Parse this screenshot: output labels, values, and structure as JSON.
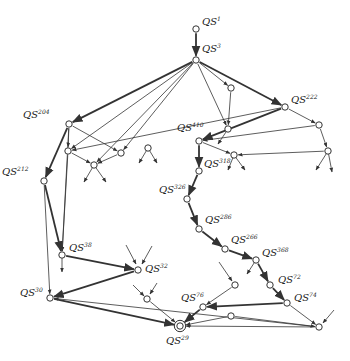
{
  "diagram": {
    "type": "state-transition-graph",
    "prefix": "QS",
    "nodes": [
      {
        "id": "QS1",
        "sup": "1",
        "x": 196,
        "y": 29,
        "label_dx": 6,
        "label_dy": -4,
        "labeled": true
      },
      {
        "id": "QS3",
        "sup": "3",
        "x": 196,
        "y": 60,
        "label_dx": 6,
        "label_dy": -8,
        "labeled": true
      },
      {
        "id": "n_a",
        "x": 231,
        "y": 88,
        "labeled": false
      },
      {
        "id": "QS222",
        "sup": "222",
        "x": 285,
        "y": 107,
        "label_dx": 6,
        "label_dy": -4,
        "labeled": true
      },
      {
        "id": "QS204",
        "sup": "204",
        "x": 69,
        "y": 124,
        "label_dx": -46,
        "label_dy": -6,
        "labeled": true
      },
      {
        "id": "n_b",
        "x": 228,
        "y": 129,
        "labeled": false
      },
      {
        "id": "n_c",
        "x": 319,
        "y": 125,
        "labeled": false
      },
      {
        "id": "QS410",
        "sup": "410",
        "x": 199,
        "y": 141,
        "label_dx": -22,
        "label_dy": -10,
        "labeled": true
      },
      {
        "id": "n_d",
        "x": 68,
        "y": 151,
        "labeled": false
      },
      {
        "id": "n_e",
        "x": 121,
        "y": 153,
        "labeled": false
      },
      {
        "id": "n_f",
        "x": 148,
        "y": 148,
        "labeled": false
      },
      {
        "id": "n_g",
        "x": 328,
        "y": 151,
        "labeled": false
      },
      {
        "id": "n_h",
        "x": 94,
        "y": 165,
        "labeled": false
      },
      {
        "id": "QS318",
        "sup": "318",
        "x": 234,
        "y": 155,
        "label_dx": -30,
        "label_dy": 12,
        "labeled": true
      },
      {
        "id": "QS212",
        "sup": "212",
        "x": 44,
        "y": 181,
        "label_dx": -42,
        "label_dy": -6,
        "labeled": true
      },
      {
        "id": "n_i",
        "x": 199,
        "y": 171,
        "labeled": false
      },
      {
        "id": "QS326",
        "sup": "326",
        "x": 187,
        "y": 199,
        "label_dx": -28,
        "label_dy": -6,
        "labeled": true
      },
      {
        "id": "QS286",
        "sup": "286",
        "x": 199,
        "y": 229,
        "label_dx": 6,
        "label_dy": -6,
        "labeled": true
      },
      {
        "id": "QS266",
        "sup": "266",
        "x": 225,
        "y": 249,
        "label_dx": 6,
        "label_dy": -6,
        "labeled": true
      },
      {
        "id": "QS38",
        "sup": "38",
        "x": 62,
        "y": 255,
        "label_dx": 7,
        "label_dy": -4,
        "labeled": true
      },
      {
        "id": "QS368",
        "sup": "368",
        "x": 256,
        "y": 260,
        "label_dx": 6,
        "label_dy": -4,
        "labeled": true
      },
      {
        "id": "QS32",
        "sup": "32",
        "x": 138,
        "y": 270,
        "label_dx": 7,
        "label_dy": 2,
        "labeled": true
      },
      {
        "id": "n_j",
        "x": 235,
        "y": 285,
        "labeled": false
      },
      {
        "id": "QS72",
        "sup": "72",
        "x": 270,
        "y": 285,
        "label_dx": 8,
        "label_dy": -2,
        "labeled": true
      },
      {
        "id": "QS30",
        "sup": "30",
        "x": 50,
        "y": 298,
        "label_dx": -30,
        "label_dy": -2,
        "labeled": true
      },
      {
        "id": "n_k",
        "x": 147,
        "y": 299,
        "labeled": false
      },
      {
        "id": "QS74",
        "sup": "74",
        "x": 287,
        "y": 303,
        "label_dx": 7,
        "label_dy": -2,
        "labeled": true
      },
      {
        "id": "QS76",
        "sup": "76",
        "x": 203,
        "y": 307,
        "label_dx": -22,
        "label_dy": -6,
        "labeled": true
      },
      {
        "id": "n_l",
        "x": 231,
        "y": 316,
        "labeled": false
      },
      {
        "id": "n_m",
        "x": 319,
        "y": 327,
        "labeled": false
      },
      {
        "id": "QS29",
        "sup": "29",
        "x": 180,
        "y": 326,
        "label_dx": -14,
        "label_dy": 18,
        "labeled": true,
        "final": true
      }
    ],
    "edges": [
      {
        "from": "QS1",
        "to": "QS3",
        "weight": "heavy"
      },
      {
        "from": "QS3",
        "to": "QS222",
        "weight": "heavy"
      },
      {
        "from": "QS3",
        "to": "QS204",
        "weight": "heavy"
      },
      {
        "from": "QS3",
        "to": "n_a",
        "weight": "light"
      },
      {
        "from": "QS3",
        "to": "n_b",
        "weight": "light"
      },
      {
        "from": "QS3",
        "to": "n_d",
        "weight": "light"
      },
      {
        "from": "QS3",
        "to": "n_h",
        "weight": "light"
      },
      {
        "from": "QS3",
        "to": "n_e",
        "weight": "light"
      },
      {
        "from": "n_a",
        "to": "n_b",
        "weight": "light"
      },
      {
        "from": "QS222",
        "to": "QS410",
        "weight": "heavy"
      },
      {
        "from": "QS222",
        "to": "n_c",
        "weight": "light"
      },
      {
        "from": "QS222",
        "to": "n_d",
        "weight": "light"
      },
      {
        "from": "n_c",
        "to": "QS410",
        "weight": "light"
      },
      {
        "from": "n_c",
        "to": "n_g",
        "weight": "light"
      },
      {
        "from": "n_g",
        "to": "QS318",
        "weight": "light"
      },
      {
        "from": "QS410",
        "to": "QS318",
        "weight": "light"
      },
      {
        "from": "QS410",
        "to": "n_i",
        "weight": "heavy"
      },
      {
        "from": "QS204",
        "to": "n_d",
        "weight": "light"
      },
      {
        "from": "QS204",
        "to": "n_e",
        "weight": "light"
      },
      {
        "from": "QS204",
        "to": "QS212",
        "weight": "heavy"
      },
      {
        "from": "QS204",
        "to": "QS38",
        "weight": "light"
      },
      {
        "from": "n_d",
        "to": "n_h",
        "weight": "light"
      },
      {
        "from": "n_d",
        "to": "QS38",
        "weight": "light"
      },
      {
        "from": "n_e",
        "to": "n_h",
        "weight": "light"
      },
      {
        "from": "QS212",
        "to": "QS38",
        "weight": "heavy"
      },
      {
        "from": "QS212",
        "to": "QS30",
        "weight": "light"
      },
      {
        "from": "n_i",
        "to": "QS326",
        "weight": "heavy"
      },
      {
        "from": "QS326",
        "to": "QS286",
        "weight": "heavy"
      },
      {
        "from": "QS286",
        "to": "QS266",
        "weight": "heavy"
      },
      {
        "from": "QS266",
        "to": "QS368",
        "weight": "heavy"
      },
      {
        "from": "QS368",
        "to": "QS72",
        "weight": "heavy"
      },
      {
        "from": "QS72",
        "to": "QS74",
        "weight": "heavy"
      },
      {
        "from": "QS38",
        "to": "QS32",
        "weight": "heavy"
      },
      {
        "from": "QS32",
        "to": "QS30",
        "weight": "heavy"
      },
      {
        "from": "QS30",
        "to": "QS29",
        "weight": "heavy"
      },
      {
        "from": "n_k",
        "to": "QS29",
        "weight": "light"
      },
      {
        "from": "QS74",
        "to": "QS76",
        "weight": "heavy"
      },
      {
        "from": "QS74",
        "to": "n_m",
        "weight": "light"
      },
      {
        "from": "n_j",
        "to": "QS76",
        "weight": "light"
      },
      {
        "from": "QS76",
        "to": "QS29",
        "weight": "heavy"
      },
      {
        "from": "n_l",
        "to": "QS29",
        "weight": "light"
      },
      {
        "from": "n_l",
        "to": "n_m",
        "weight": "light"
      },
      {
        "from": "n_m",
        "to": "QS29",
        "weight": "light"
      },
      {
        "from": "n_m",
        "to": "QS30",
        "weight": "light"
      }
    ],
    "stubs": [
      {
        "x1": 228,
        "y1": 129,
        "x2": 218,
        "y2": 144,
        "dir": "out"
      },
      {
        "x1": 148,
        "y1": 148,
        "x2": 139,
        "y2": 163,
        "dir": "out"
      },
      {
        "x1": 148,
        "y1": 148,
        "x2": 157,
        "y2": 163,
        "dir": "out"
      },
      {
        "x1": 94,
        "y1": 165,
        "x2": 84,
        "y2": 182,
        "dir": "out"
      },
      {
        "x1": 94,
        "y1": 165,
        "x2": 106,
        "y2": 182,
        "dir": "out"
      },
      {
        "x1": 328,
        "y1": 151,
        "x2": 316,
        "y2": 170,
        "dir": "out"
      },
      {
        "x1": 328,
        "y1": 151,
        "x2": 332,
        "y2": 172,
        "dir": "out"
      },
      {
        "x1": 234,
        "y1": 155,
        "x2": 228,
        "y2": 170,
        "dir": "out"
      },
      {
        "x1": 234,
        "y1": 155,
        "x2": 245,
        "y2": 170,
        "dir": "out"
      },
      {
        "x1": 62,
        "y1": 255,
        "x2": 62,
        "y2": 272,
        "dir": "out"
      },
      {
        "x1": 126,
        "y1": 245,
        "x2": 136,
        "y2": 264,
        "dir": "in"
      },
      {
        "x1": 152,
        "y1": 246,
        "x2": 142,
        "y2": 264,
        "dir": "in"
      },
      {
        "x1": 133,
        "y1": 285,
        "x2": 144,
        "y2": 296,
        "dir": "in"
      },
      {
        "x1": 157,
        "y1": 283,
        "x2": 150,
        "y2": 294,
        "dir": "in"
      },
      {
        "x1": 256,
        "y1": 260,
        "x2": 247,
        "y2": 274,
        "dir": "out"
      },
      {
        "x1": 219,
        "y1": 262,
        "x2": 232,
        "y2": 281,
        "dir": "in"
      },
      {
        "x1": 334,
        "y1": 310,
        "x2": 323,
        "y2": 323,
        "dir": "in"
      }
    ]
  }
}
